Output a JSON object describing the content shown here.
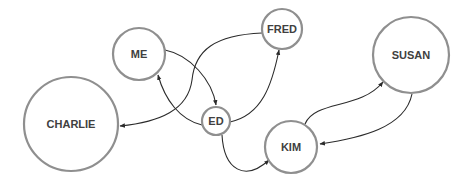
{
  "diagram": {
    "type": "directed-graph",
    "colors": {
      "node_stroke": "#8f8f8f",
      "node_fill": "#ffffff",
      "label": "#404040",
      "edge": "#2b2b2b"
    },
    "nodes": [
      {
        "id": "me",
        "label": "ME",
        "cx": 139,
        "cy": 54,
        "r": 26
      },
      {
        "id": "fred",
        "label": "FRED",
        "cx": 282,
        "cy": 29,
        "r": 20
      },
      {
        "id": "ed",
        "label": "ED",
        "cx": 216,
        "cy": 121,
        "r": 14
      },
      {
        "id": "charlie",
        "label": "CHARLIE",
        "cx": 71,
        "cy": 124,
        "r": 47
      },
      {
        "id": "susan",
        "label": "SUSAN",
        "cx": 411,
        "cy": 55,
        "r": 38
      },
      {
        "id": "kim",
        "label": "KIM",
        "cx": 291,
        "cy": 147,
        "r": 26
      }
    ],
    "edges": [
      {
        "from": "ME",
        "to": "ED",
        "path": "M165,50 C190,55 212,80 216,105"
      },
      {
        "from": "ED",
        "to": "ME",
        "path": "M202,125 C180,120 165,100 158,75"
      },
      {
        "from": "FRED",
        "to": "CHARLIE",
        "path": "M262,33 C215,35 195,50 192,80 C188,110 160,122 120,126"
      },
      {
        "from": "ED",
        "to": "FRED",
        "path": "M230,122 C262,115 272,85 279,50"
      },
      {
        "from": "ED",
        "to": "KIM",
        "path": "M222,135 C224,170 245,182 269,160"
      },
      {
        "from": "KIM",
        "to": "SUSAN",
        "path": "M305,124 C315,100 360,110 383,82"
      },
      {
        "from": "SUSAN",
        "to": "KIM",
        "path": "M412,94 C405,128 360,138 320,144"
      }
    ]
  }
}
